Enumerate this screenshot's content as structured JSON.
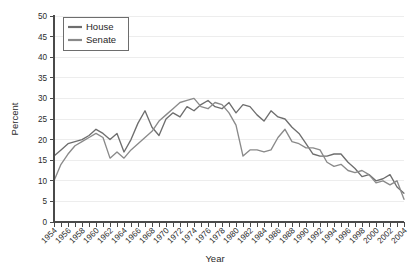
{
  "chart_data": {
    "type": "line",
    "title": "",
    "xlabel": "Year",
    "ylabel": "Percent",
    "xlim": [
      1954,
      2004
    ],
    "ylim": [
      0,
      50
    ],
    "ytick_step": 5,
    "yticks": [
      0,
      5,
      10,
      15,
      20,
      25,
      30,
      35,
      40,
      45,
      50
    ],
    "xtick_labels": [
      "1954",
      "1956",
      "1958",
      "1960",
      "1962",
      "1964",
      "1966",
      "1968",
      "1970",
      "1972",
      "1974",
      "1976",
      "1978",
      "1980",
      "1982",
      "1984",
      "1986",
      "1988",
      "1990",
      "1992",
      "1994",
      "1996",
      "1998",
      "2000",
      "2002",
      "2004"
    ],
    "xtick_label_step": 2,
    "minor_tick_step": 1,
    "grid": "horizontal",
    "legend_position": "top-left",
    "x": [
      1954,
      1955,
      1956,
      1957,
      1958,
      1959,
      1960,
      1961,
      1962,
      1963,
      1964,
      1965,
      1966,
      1967,
      1968,
      1969,
      1970,
      1971,
      1972,
      1973,
      1974,
      1975,
      1976,
      1977,
      1978,
      1979,
      1980,
      1981,
      1982,
      1983,
      1984,
      1985,
      1986,
      1987,
      1988,
      1989,
      1990,
      1991,
      1992,
      1993,
      1994,
      1995,
      1996,
      1997,
      1998,
      1999,
      2000,
      2001,
      2002,
      2003,
      2004
    ],
    "series": [
      {
        "name": "House",
        "color": "#6e6e6e",
        "values": [
          16.0,
          17.5,
          19.0,
          19.5,
          20.0,
          21.0,
          22.5,
          21.5,
          20.0,
          21.5,
          17.0,
          20.0,
          24.0,
          27.0,
          23.0,
          21.0,
          25.0,
          26.5,
          25.5,
          28.0,
          27.0,
          28.5,
          29.5,
          28.0,
          27.5,
          29.0,
          26.5,
          28.5,
          28.0,
          26.0,
          24.5,
          27.0,
          25.5,
          25.0,
          23.0,
          21.5,
          19.0,
          16.5,
          16.0,
          16.0,
          16.5,
          16.5,
          14.5,
          13.0,
          11.0,
          11.5,
          10.0,
          10.5,
          11.5,
          8.5,
          7.0
        ]
      },
      {
        "name": "Senate",
        "color": "#8a8a8a",
        "values": [
          10.0,
          14.0,
          16.5,
          18.5,
          19.5,
          20.5,
          21.5,
          20.5,
          15.5,
          17.0,
          15.5,
          17.5,
          19.0,
          20.5,
          22.0,
          24.5,
          26.0,
          27.5,
          29.0,
          29.5,
          30.0,
          28.0,
          27.5,
          29.0,
          28.5,
          26.5,
          23.5,
          16.0,
          17.5,
          17.5,
          17.0,
          17.5,
          20.5,
          22.5,
          19.5,
          19.0,
          18.0,
          18.0,
          17.5,
          14.5,
          13.5,
          14.0,
          12.5,
          12.0,
          12.5,
          11.5,
          9.5,
          10.0,
          9.0,
          10.0,
          5.5
        ]
      }
    ],
    "legend": [
      {
        "label": "House",
        "color": "#6e6e6e"
      },
      {
        "label": "Senate",
        "color": "#8a8a8a"
      }
    ]
  },
  "geometry": {
    "plot_left": 54,
    "plot_right": 404,
    "plot_top": 16,
    "plot_bottom": 222
  }
}
